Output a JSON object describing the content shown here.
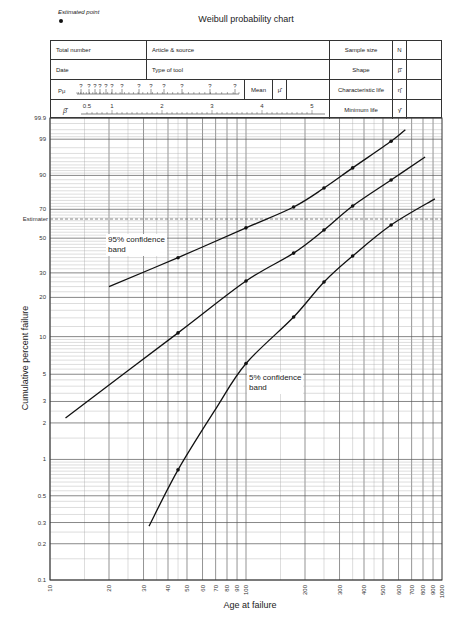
{
  "header": {
    "estimated_point_label": "Estimated point",
    "title": "Weibull probability chart",
    "rows": [
      {
        "left": "Total number",
        "middle": "Article & source",
        "right_label": "Sample size",
        "symbol": "N"
      },
      {
        "left": "Date",
        "middle": "Type of tool",
        "right_label": "Shape",
        "symbol": "β̂"
      },
      {
        "pu_label": "Pμ",
        "pu_marks": [
          "?",
          "?",
          "?",
          "?",
          "?",
          "?",
          "?",
          "?",
          "?",
          "?",
          "?",
          "?",
          "?"
        ],
        "mean_label": "Mean",
        "mean_symbol": "μ̂",
        "right_label": "Characteristic life",
        "symbol": "η̂"
      },
      {
        "beta_label": "β̂",
        "beta_ticks": [
          "0.5",
          "1",
          "2",
          "3",
          "4",
          "5"
        ],
        "right_label": "Minimum life",
        "symbol": "γ̂"
      }
    ]
  },
  "annotations": {
    "estimater_label": "Estimater",
    "band_95": [
      "95% confidence",
      "band"
    ],
    "band_5": [
      "5% confidence",
      "band"
    ]
  },
  "chart_data": {
    "type": "line",
    "title": "Weibull probability chart",
    "xlabel": "Age at failure",
    "ylabel": "Cumulative percent failure",
    "x_scale": "log",
    "y_scale": "weibull",
    "xlim": [
      10,
      1000
    ],
    "ylim": [
      0.1,
      99.9
    ],
    "x_ticks": [
      "10",
      "20",
      "30",
      "40",
      "50",
      "60",
      "70",
      "80",
      "90",
      "100",
      "200",
      "300",
      "400",
      "500",
      "600",
      "700",
      "800",
      "900",
      "1000"
    ],
    "y_ticks": [
      "0.1",
      "0.2",
      "0.3",
      "0.5",
      "1",
      "2",
      "3",
      "5",
      "10",
      "20",
      "30",
      "50",
      "70",
      "90",
      "99",
      "99.9"
    ],
    "grid": true,
    "estimater_line_y": 63.2,
    "series": [
      {
        "name": "95% confidence band",
        "curve": [
          [
            20,
            24
          ],
          [
            45,
            38
          ],
          [
            100,
            57
          ],
          [
            175,
            71.6
          ],
          [
            250,
            83.6
          ],
          [
            350,
            93
          ],
          [
            550,
            98.8
          ],
          [
            650,
            99.6
          ]
        ],
        "points": [
          [
            45,
            37.9
          ],
          [
            100,
            57
          ],
          [
            175,
            71.6
          ],
          [
            250,
            83.6
          ],
          [
            350,
            93
          ],
          [
            550,
            98.8
          ]
        ]
      },
      {
        "name": "Estimated (median) line",
        "curve": [
          [
            12,
            2.2
          ],
          [
            45,
            10.7
          ],
          [
            100,
            26.3
          ],
          [
            175,
            40.6
          ],
          [
            250,
            55.5
          ],
          [
            350,
            72.3
          ],
          [
            550,
            87.9
          ],
          [
            820,
            96.2
          ]
        ],
        "points": [
          [
            45,
            10.7
          ],
          [
            100,
            26.3
          ],
          [
            175,
            40.6
          ],
          [
            250,
            55.5
          ],
          [
            350,
            72.3
          ],
          [
            550,
            87.9
          ]
        ]
      },
      {
        "name": "5% confidence band",
        "curve": [
          [
            32,
            0.28
          ],
          [
            45,
            0.82
          ],
          [
            70,
            2.6
          ],
          [
            100,
            6.1
          ],
          [
            175,
            14.2
          ],
          [
            250,
            25.9
          ],
          [
            350,
            38.9
          ],
          [
            550,
            59
          ],
          [
            920,
            77
          ]
        ],
        "points": [
          [
            45,
            0.82
          ],
          [
            100,
            6.1
          ],
          [
            175,
            14.2
          ],
          [
            250,
            25.9
          ],
          [
            350,
            38.9
          ],
          [
            550,
            59
          ]
        ]
      }
    ]
  }
}
